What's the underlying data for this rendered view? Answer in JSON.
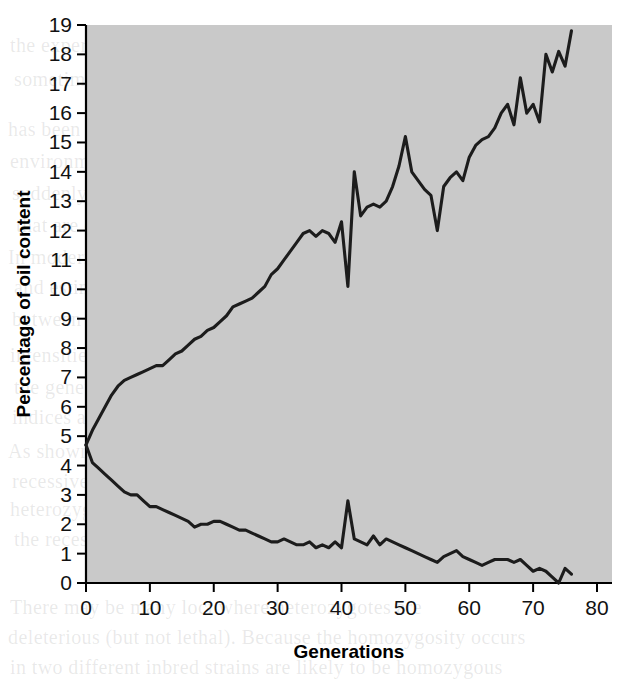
{
  "figure": {
    "name": "oil-content-selection-experiment",
    "background_color": "#ffffff",
    "plot_area_color": "#c9c9c9",
    "line_color": "#1c1c1c"
  },
  "bleed_text": [
    {
      "text": "the experiment was carried out, to",
      "x": 10,
      "y": 34
    },
    {
      "text": "sometimes observed in selection",
      "x": 14,
      "y": 68
    },
    {
      "text": "has been proposed that when an animal is moved into",
      "x": 8,
      "y": 118
    },
    {
      "text": "environment, a number of genes that were previously",
      "x": 10,
      "y": 150
    },
    {
      "text": "suddenly become active, and this may lead to",
      "x": 12,
      "y": 182
    },
    {
      "text": "that are correlated between the",
      "x": 16,
      "y": 214
    },
    {
      "text": "In modern selection programmes, breeders",
      "x": 8,
      "y": 246
    },
    {
      "text": "and estimates are made of genetic and",
      "x": 14,
      "y": 276
    },
    {
      "text": "between the traits. Selection indices",
      "x": 12,
      "y": 308
    },
    {
      "text": "intensities on each of the traits that will result in",
      "x": 10,
      "y": 344
    },
    {
      "text": "the genetic advance over the",
      "x": 14,
      "y": 376
    },
    {
      "text": "indices and genetic correlations are",
      "x": 12,
      "y": 406
    },
    {
      "text": "As shown in Figure 16.4, two alleles at the same locus may",
      "x": 8,
      "y": 440
    },
    {
      "text": "recessive, expressed in the homozygote, whereas the",
      "x": 12,
      "y": 470
    },
    {
      "text": "heterozygous, so an individual that is heterozygous carries",
      "x": 10,
      "y": 498
    },
    {
      "text": "the recessive allele but does not express it",
      "x": 14,
      "y": 528
    },
    {
      "text": "There may be many loci where heterozygotes are",
      "x": 10,
      "y": 596
    },
    {
      "text": "deleterious (but not lethal). Because the homozygosity occurs",
      "x": 8,
      "y": 626
    },
    {
      "text": "in two different inbred strains are likely to be homozygous",
      "x": 10,
      "y": 656
    }
  ],
  "chart_data": {
    "type": "line",
    "title": "",
    "xlabel": "Generations",
    "ylabel": "Percentage of oil content",
    "xlim": [
      0,
      80
    ],
    "ylim": [
      0,
      19
    ],
    "xticks": [
      0,
      10,
      20,
      30,
      40,
      50,
      60,
      70,
      80
    ],
    "yticks": [
      0,
      1,
      2,
      3,
      4,
      5,
      6,
      7,
      8,
      9,
      10,
      11,
      12,
      13,
      14,
      15,
      16,
      17,
      18,
      19
    ],
    "grid": false,
    "legend": false,
    "legend_position": "none",
    "series": [
      {
        "name": "High oil selection line",
        "x": [
          0,
          1,
          2,
          3,
          4,
          5,
          6,
          7,
          8,
          9,
          10,
          11,
          12,
          13,
          14,
          15,
          16,
          17,
          18,
          19,
          20,
          21,
          22,
          23,
          24,
          25,
          26,
          27,
          28,
          29,
          30,
          31,
          32,
          33,
          34,
          35,
          36,
          37,
          38,
          39,
          40,
          41,
          42,
          43,
          44,
          45,
          46,
          47,
          48,
          49,
          50,
          51,
          52,
          53,
          54,
          55,
          56,
          57,
          58,
          59,
          60,
          61,
          62,
          63,
          64,
          65,
          66,
          67,
          68,
          69,
          70,
          71,
          72,
          73,
          74,
          75,
          76
        ],
        "values": [
          4.7,
          5.2,
          5.6,
          6.0,
          6.4,
          6.7,
          6.9,
          7.0,
          7.1,
          7.2,
          7.3,
          7.4,
          7.4,
          7.6,
          7.8,
          7.9,
          8.1,
          8.3,
          8.4,
          8.6,
          8.7,
          8.9,
          9.1,
          9.4,
          9.5,
          9.6,
          9.7,
          9.9,
          10.1,
          10.5,
          10.7,
          11.0,
          11.3,
          11.6,
          11.9,
          12.0,
          11.8,
          12.0,
          11.9,
          11.6,
          12.3,
          10.1,
          14.0,
          12.5,
          12.8,
          12.9,
          12.8,
          13.0,
          13.5,
          14.2,
          15.2,
          14.0,
          13.7,
          13.4,
          13.2,
          12.0,
          13.5,
          13.8,
          14.0,
          13.7,
          14.5,
          14.9,
          15.1,
          15.2,
          15.5,
          16.0,
          16.3,
          15.6,
          17.2,
          16.0,
          16.3,
          15.7,
          18.0,
          17.4,
          18.1,
          17.6,
          18.8
        ]
      },
      {
        "name": "Low oil selection line",
        "x": [
          0,
          1,
          2,
          3,
          4,
          5,
          6,
          7,
          8,
          9,
          10,
          11,
          12,
          13,
          14,
          15,
          16,
          17,
          18,
          19,
          20,
          21,
          22,
          23,
          24,
          25,
          26,
          27,
          28,
          29,
          30,
          31,
          32,
          33,
          34,
          35,
          36,
          37,
          38,
          39,
          40,
          41,
          42,
          43,
          44,
          45,
          46,
          47,
          48,
          49,
          50,
          51,
          52,
          53,
          54,
          55,
          56,
          57,
          58,
          59,
          60,
          61,
          62,
          63,
          64,
          65,
          66,
          67,
          68,
          69,
          70,
          71,
          72,
          73,
          74,
          75,
          76
        ],
        "values": [
          4.7,
          4.1,
          3.9,
          3.7,
          3.5,
          3.3,
          3.1,
          3.0,
          3.0,
          2.8,
          2.6,
          2.6,
          2.5,
          2.4,
          2.3,
          2.2,
          2.1,
          1.9,
          2.0,
          2.0,
          2.1,
          2.1,
          2.0,
          1.9,
          1.8,
          1.8,
          1.7,
          1.6,
          1.5,
          1.4,
          1.4,
          1.5,
          1.4,
          1.3,
          1.3,
          1.4,
          1.2,
          1.3,
          1.2,
          1.4,
          1.2,
          2.8,
          1.5,
          1.4,
          1.3,
          1.6,
          1.3,
          1.5,
          1.4,
          1.3,
          1.2,
          1.1,
          1.0,
          0.9,
          0.8,
          0.7,
          0.9,
          1.0,
          1.1,
          0.9,
          0.8,
          0.7,
          0.6,
          0.7,
          0.8,
          0.8,
          0.8,
          0.7,
          0.8,
          0.6,
          0.4,
          0.5,
          0.4,
          0.2,
          0.0,
          0.5,
          0.3
        ]
      }
    ]
  }
}
